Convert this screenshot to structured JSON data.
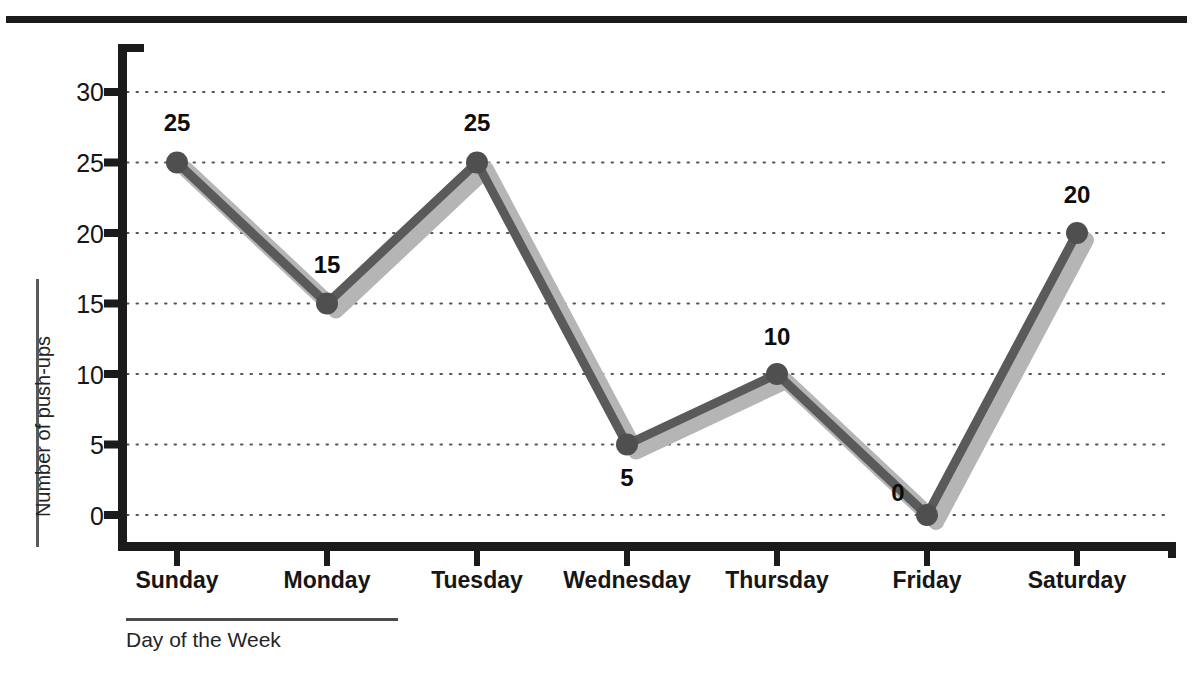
{
  "chart_data": {
    "type": "line",
    "title": "",
    "xlabel": "Day of the Week",
    "ylabel": "Number of push-ups",
    "categories": [
      "Sunday",
      "Monday",
      "Tuesday",
      "Wednesday",
      "Thursday",
      "Friday",
      "Saturday"
    ],
    "values": [
      25,
      15,
      25,
      5,
      10,
      0,
      20
    ],
    "point_labels": [
      "25",
      "15",
      "25",
      "5",
      "10",
      "0",
      "20"
    ],
    "ylim": [
      0,
      30
    ],
    "ytick_labels": [
      "0",
      "5",
      "10",
      "15",
      "20",
      "25",
      "30"
    ],
    "ytick_values": [
      0,
      5,
      10,
      15,
      20,
      25,
      30
    ],
    "grid": true,
    "grid_style": "dotted",
    "legend": "none",
    "colors": {
      "line": "#5a5a5a",
      "marker": "#4f4f4f",
      "shadow": "#b5b5b5",
      "axis": "#1b1b1b",
      "grid": "#555555",
      "text": "#161616",
      "background": "#ffffff"
    }
  },
  "axes": {
    "y_title": "Number of push-ups",
    "x_title": "Day of the Week"
  }
}
